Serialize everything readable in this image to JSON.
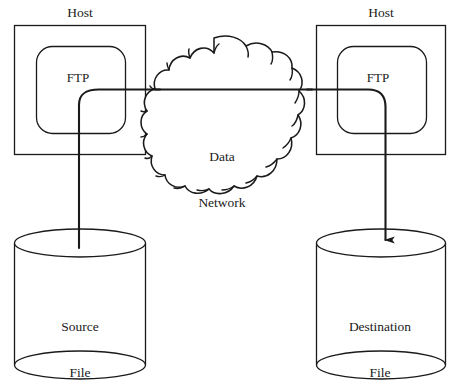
{
  "diagram": {
    "stroke_color": "#1a1a1a",
    "background_color": "#ffffff",
    "nodes": {
      "host_left": {
        "label": "Host",
        "inner_label": "FTP"
      },
      "host_right": {
        "label": "Host",
        "inner_label": "FTP"
      },
      "cloud": {
        "label": "Data\nNetwork",
        "line1": "Data",
        "line2": "Network"
      },
      "source_store": {
        "label": "Source\nFile",
        "line1": "Source",
        "line2": "File"
      },
      "destination_store": {
        "label": "Destination\nFile",
        "line1": "Destination",
        "line2": "File"
      }
    },
    "connections": [
      {
        "name": "source-file-to-ftp",
        "from": "source_store",
        "to": "host_left_ftp",
        "arrowhead": false
      },
      {
        "name": "ftp-to-ftp-across-network",
        "from": "host_left_ftp",
        "to": "host_right_ftp",
        "arrowhead": false
      },
      {
        "name": "ftp-to-destination-file",
        "from": "host_right_ftp",
        "to": "destination_store",
        "arrowhead": true
      }
    ]
  }
}
